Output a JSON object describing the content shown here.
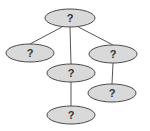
{
  "diagram": {
    "type": "tree",
    "colors": {
      "node_fill": "#d9d9d9",
      "node_stroke": "#4a4a4a",
      "edge": "#555555",
      "label": "#333333",
      "background": "#ffffff"
    },
    "nodes": [
      {
        "id": "root",
        "label": "?",
        "cx": 70,
        "cy": 18,
        "rx": 25,
        "ry": 9
      },
      {
        "id": "left",
        "label": "?",
        "cx": 30,
        "cy": 53,
        "rx": 24,
        "ry": 9
      },
      {
        "id": "right",
        "label": "?",
        "cx": 113,
        "cy": 54,
        "rx": 24,
        "ry": 9
      },
      {
        "id": "middle",
        "label": "?",
        "cx": 71,
        "cy": 73,
        "rx": 24,
        "ry": 9
      },
      {
        "id": "right-child",
        "label": "?",
        "cx": 112,
        "cy": 93,
        "rx": 24,
        "ry": 9
      },
      {
        "id": "bottom",
        "label": "?",
        "cx": 71,
        "cy": 115,
        "rx": 24,
        "ry": 9
      }
    ],
    "edges": [
      {
        "from": "root",
        "to": "left"
      },
      {
        "from": "root",
        "to": "middle"
      },
      {
        "from": "root",
        "to": "right"
      },
      {
        "from": "right",
        "to": "right-child"
      },
      {
        "from": "middle",
        "to": "bottom"
      }
    ]
  }
}
